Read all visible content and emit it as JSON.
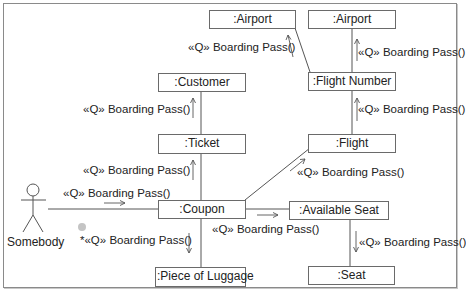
{
  "diagram": {
    "type": "UML communication diagram",
    "colors": {
      "frame": "#8a8a8a",
      "box_border": "#6a6a6a",
      "line": "#555555",
      "text": "#222222",
      "dot": "#c4c4c4"
    },
    "actor": {
      "label": "Somebody",
      "icon": "stick-figure-icon"
    },
    "objects": [
      {
        "id": "airport_left",
        "label": ":Airport"
      },
      {
        "id": "airport_right",
        "label": ":Airport"
      },
      {
        "id": "customer",
        "label": ":Customer"
      },
      {
        "id": "flight_number",
        "label": ":Flight Number"
      },
      {
        "id": "ticket",
        "label": ":Ticket"
      },
      {
        "id": "flight",
        "label": ":Flight"
      },
      {
        "id": "coupon",
        "label": ":Coupon"
      },
      {
        "id": "available_seat",
        "label": ":Available Seat"
      },
      {
        "id": "piece_of_luggage",
        "label": ":Piece of Luggage"
      },
      {
        "id": "seat",
        "label": ":Seat"
      }
    ],
    "messages": [
      {
        "from": "Somebody",
        "to": ":Coupon",
        "label": "«Q» Boarding Pass()",
        "arrow": "right"
      },
      {
        "from": ":Coupon",
        "to": ":Ticket",
        "label": "«Q» Boarding Pass()",
        "arrow": "up"
      },
      {
        "from": ":Ticket",
        "to": ":Customer",
        "label": "«Q» Boarding Pass()",
        "arrow": "up"
      },
      {
        "from": ":Flight Number",
        "to": ":Airport",
        "label": "«Q» Boarding Pass()",
        "arrow": "up-left"
      },
      {
        "from": ":Flight Number",
        "to": ":Airport",
        "label": "«Q» Boarding Pass()",
        "arrow": "up"
      },
      {
        "from": ":Flight",
        "to": ":Flight Number",
        "label": "«Q» Boarding Pass()",
        "arrow": "up"
      },
      {
        "from": ":Coupon",
        "to": ":Flight",
        "label": "«Q» Boarding Pass()",
        "arrow": "up-right"
      },
      {
        "from": ":Coupon",
        "to": ":Available Seat",
        "label": "«Q» Boarding Pass()",
        "arrow": "right"
      },
      {
        "from": ":Available Seat",
        "to": ":Seat",
        "label": "«Q» Boarding Pass()",
        "arrow": "down"
      },
      {
        "from": ":Coupon",
        "to": ":Piece of Luggage",
        "label": "*«Q» Boarding Pass()",
        "arrow": "down"
      }
    ]
  }
}
